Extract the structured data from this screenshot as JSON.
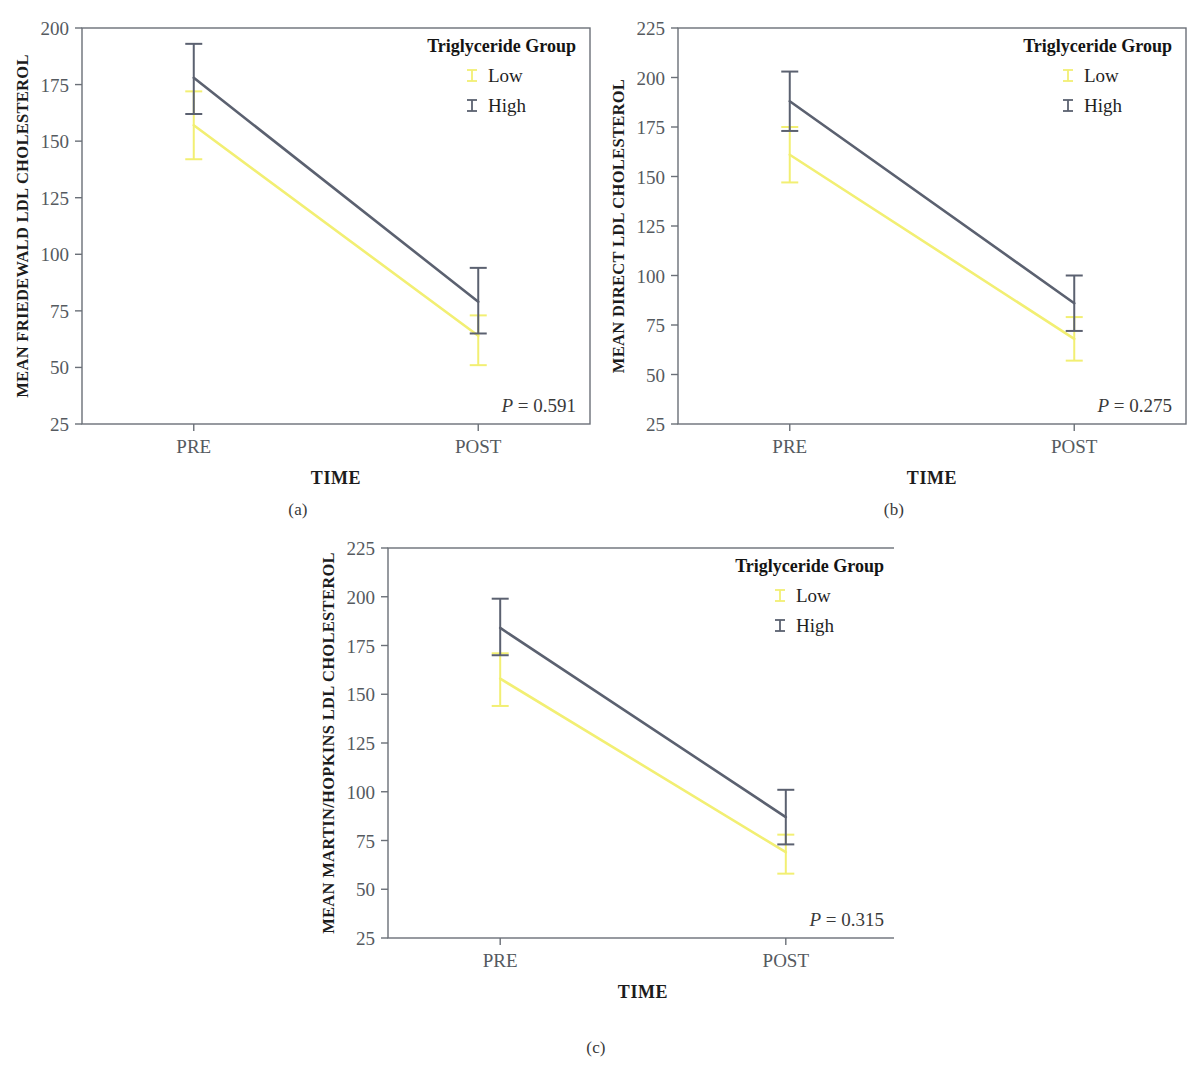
{
  "figure": {
    "panels": [
      {
        "id": "a",
        "caption": "(a)",
        "ylabel": "MEAN FRIEDEWALD LDL CHOLESTEROL",
        "xlabel": "TIME",
        "pvalue_prefix": "P",
        "pvalue_text": " = 0.591",
        "legend_title": "Triglyceride Group",
        "legend": [
          {
            "label": "Low",
            "color": "#f2ef73"
          },
          {
            "label": "High",
            "color": "#5b6170"
          }
        ],
        "chart_data": {
          "type": "line",
          "title": "",
          "xlabel": "TIME",
          "ylabel": "MEAN FRIEDEWALD LDL CHOLESTEROL",
          "categories": [
            "PRE",
            "POST"
          ],
          "ylim": [
            25,
            200
          ],
          "yticks": [
            25,
            50,
            75,
            100,
            125,
            150,
            175,
            200
          ],
          "grid": false,
          "legend_position": "top-right",
          "error_bar_type": "95% CI",
          "series": [
            {
              "name": "Low",
              "color": "#f2ef73",
              "values": [
                157,
                64
              ],
              "err_low": [
                142,
                51
              ],
              "err_high": [
                172,
                73
              ]
            },
            {
              "name": "High",
              "color": "#5b6170",
              "values": [
                178,
                79
              ],
              "err_low": [
                162,
                65
              ],
              "err_high": [
                193,
                94
              ]
            }
          ],
          "annotations": [
            "P = 0.591"
          ]
        }
      },
      {
        "id": "b",
        "caption": "(b)",
        "ylabel": "MEAN DIRECT LDL CHOLESTEROL",
        "xlabel": "TIME",
        "pvalue_prefix": "P",
        "pvalue_text": " = 0.275",
        "legend_title": "Triglyceride Group",
        "legend": [
          {
            "label": "Low",
            "color": "#f2ef73"
          },
          {
            "label": "High",
            "color": "#5b6170"
          }
        ],
        "chart_data": {
          "type": "line",
          "title": "",
          "xlabel": "TIME",
          "ylabel": "MEAN DIRECT LDL CHOLESTEROL",
          "categories": [
            "PRE",
            "POST"
          ],
          "ylim": [
            25,
            225
          ],
          "yticks": [
            25,
            50,
            75,
            100,
            125,
            150,
            175,
            200,
            225
          ],
          "grid": false,
          "legend_position": "top-right",
          "error_bar_type": "95% CI",
          "series": [
            {
              "name": "Low",
              "color": "#f2ef73",
              "values": [
                161,
                68
              ],
              "err_low": [
                147,
                57
              ],
              "err_high": [
                175,
                79
              ]
            },
            {
              "name": "High",
              "color": "#5b6170",
              "values": [
                188,
                86
              ],
              "err_low": [
                173,
                72
              ],
              "err_high": [
                203,
                100
              ]
            }
          ],
          "annotations": [
            "P = 0.275"
          ]
        }
      },
      {
        "id": "c",
        "caption": "(c)",
        "ylabel": "MEAN MARTIN/HOPKINS LDL CHOLESTEROL",
        "xlabel": "TIME",
        "pvalue_prefix": "P",
        "pvalue_text": " = 0.315",
        "legend_title": "Triglyceride Group",
        "legend": [
          {
            "label": "Low",
            "color": "#f2ef73"
          },
          {
            "label": "High",
            "color": "#5b6170"
          }
        ],
        "chart_data": {
          "type": "line",
          "title": "",
          "xlabel": "TIME",
          "ylabel": "MEAN MARTIN/HOPKINS LDL CHOLESTEROL",
          "categories": [
            "PRE",
            "POST"
          ],
          "ylim": [
            25,
            225
          ],
          "yticks": [
            25,
            50,
            75,
            100,
            125,
            150,
            175,
            200,
            225
          ],
          "grid": false,
          "legend_position": "top-right",
          "error_bar_type": "95% CI",
          "series": [
            {
              "name": "Low",
              "color": "#f2ef73",
              "values": [
                158,
                69
              ],
              "err_low": [
                144,
                58
              ],
              "err_high": [
                171,
                78
              ]
            },
            {
              "name": "High",
              "color": "#5b6170",
              "values": [
                184,
                87
              ],
              "err_low": [
                170,
                73
              ],
              "err_high": [
                199,
                101
              ]
            }
          ],
          "annotations": [
            "P = 0.315"
          ]
        }
      }
    ]
  },
  "colors": {
    "low": "#f2ef73",
    "high": "#5b6170",
    "axis": "#6b7078",
    "tick_text": "#555a60",
    "label_text": "#1c1c1c"
  }
}
